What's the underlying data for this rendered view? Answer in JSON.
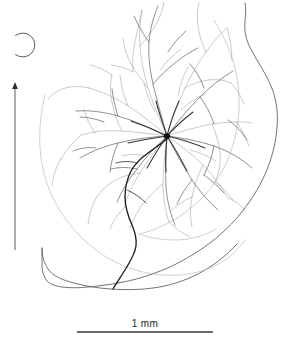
{
  "figure": {
    "kind": "camera-lucida-neuron-drawing",
    "background_color": "#ffffff",
    "width": 293,
    "height": 349
  },
  "scalebar": {
    "label": "1 mm",
    "length_mm": 1,
    "x_start": 77,
    "x_end": 213,
    "y": 332,
    "color": "#3a3a3a",
    "thickness": 1.4
  },
  "colors": {
    "outline": "#5a5a5a",
    "inner_contour": "#b9b9b9",
    "dendrite_fine": "#7d7d7d",
    "dendrite_mid": "#5c5c5c",
    "dendrite_dark": "#2e2e2e",
    "axon": "#1d1d1d",
    "soma": "#101010",
    "marker": "#4a4a4a"
  },
  "annotations": {
    "soma": {
      "name": "soma",
      "x": 167,
      "y": 136,
      "radius": 3.2
    },
    "open_circle_marker": {
      "name": "open-circle-marker",
      "cx": 21,
      "cy": 45,
      "r": 12,
      "gap_deg": 52
    },
    "orientation_arrow": {
      "name": "orientation-arrow",
      "x": 15,
      "y_tip": 83,
      "y_base": 250,
      "head_size": 3.4
    }
  },
  "paths": {
    "tissue_outline": "M245,4 C247,16 243,26 246,38 C250,52 256,60 262,72 C268,84 273,96 276,108 C279,121 278,134 276,147 C274,162 270,176 264,190 C257,206 247,221 234,236 C221,251 206,263 189,272 C176,279 164,284 152,286 C140,288 128,288 117,288 C104,288 92,286 80,284 C70,282 62,280 55,277 C49,274 45,270 43,265 C41,259 41,253 41,247",
    "tissue_outline_bottom": "M41,247 C41,258 43,268 48,275 C54,282 64,285 76,287 C92,289 108,289 124,289 C140,289 156,288 170,285 C186,282 200,277 212,270 C226,262 238,251 247,239",
    "inner_contour_left": "M44,95 C40,112 38,130 39,148 C40,167 45,186 54,203 C64,222 78,238 95,251 C112,264 132,272 152,275 C172,278 192,276 209,269 C224,263 236,253 244,241",
    "inner_contour_right": "M221,26 C232,44 239,65 241,87 C243,110 240,133 232,154 C224,175 211,193 195,207 C180,220 162,229 144,233",
    "axon": "M168,138 C164,142 157,147 150,152 C143,157 136,163 131,170 C126,178 124,187 124,196 C124,206 127,215 131,224 C134,231 136,238 135,245 C134,253 129,261 124,269 C119,277 115,283 113,288"
  },
  "dendrites": {
    "field_bounds": {
      "x_min": 48,
      "x_max": 252,
      "y_min": 2,
      "y_max": 248
    },
    "primary_branch_count": 9,
    "description": "Radiating dendritic arbor centered on soma, densest near center, fine terminal twigs extending to field margins"
  }
}
